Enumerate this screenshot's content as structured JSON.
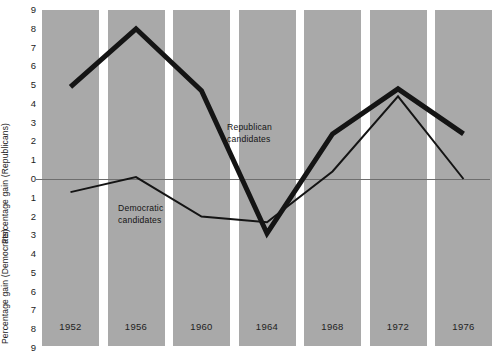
{
  "chart_data": {
    "type": "line",
    "title": "",
    "subtitle": "",
    "xlabel": "",
    "ylabel_top": "Percentage gain (Republicans)",
    "ylabel_bottom": "Percentage gain (Democrats)",
    "categories": [
      "1952",
      "1956",
      "1960",
      "1964",
      "1968",
      "1972",
      "1976"
    ],
    "ylim": [
      -9,
      9
    ],
    "yticks": [
      9,
      8,
      7,
      6,
      5,
      4,
      3,
      2,
      1,
      0,
      1,
      2,
      3,
      4,
      5,
      6,
      7,
      8,
      9
    ],
    "ytick_values": [
      9,
      8,
      7,
      6,
      5,
      4,
      3,
      2,
      1,
      0,
      -1,
      -2,
      -3,
      -4,
      -5,
      -6,
      -7,
      -8,
      -9
    ],
    "grid": false,
    "legend_position": "inline-annotation",
    "zero_line": 0,
    "band_color": "#a9a9a9",
    "background_color": "#ffffff",
    "line_color": "#141414",
    "series": [
      {
        "name": "Republican candidates",
        "line_width_px": 5,
        "values": [
          4.9,
          8.0,
          4.7,
          -2.9,
          2.4,
          4.8,
          2.4
        ]
      },
      {
        "name": "Democratic candidates",
        "line_width_px": 2,
        "values": [
          -0.7,
          0.1,
          -2.0,
          -2.3,
          0.4,
          4.4,
          0.0
        ]
      }
    ],
    "annotations": [
      {
        "id": "republican",
        "text": "Republican\ncandidates"
      },
      {
        "id": "democratic",
        "text": "Democratic\ncandidates"
      }
    ]
  }
}
